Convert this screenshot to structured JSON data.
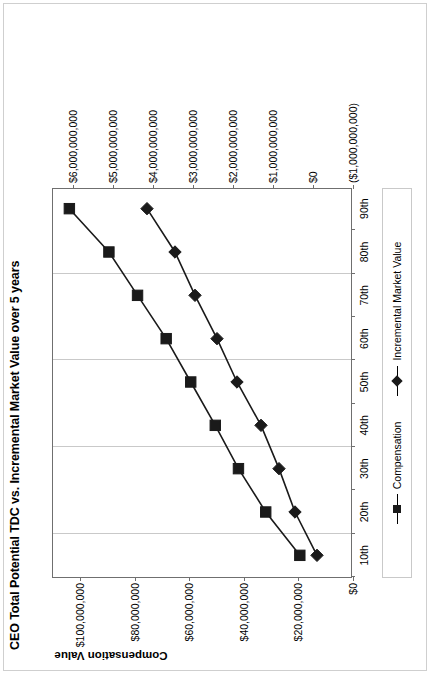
{
  "chart_data": {
    "type": "line",
    "title": "CEO Total Potential TDC vs. Incremental Market Value over 5 years",
    "xlabel": "",
    "categories": [
      "10th",
      "20th",
      "30th",
      "40th",
      "50th",
      "60th",
      "70th",
      "80th",
      "90th"
    ],
    "grid": true,
    "legend_position": "bottom",
    "primary_axis": {
      "label": "Compensation Value",
      "side": "left",
      "ticks": [
        "$0",
        "$20,000,000",
        "$40,000,000",
        "$60,000,000",
        "$80,000,000",
        "$100,000,000"
      ],
      "tick_values": [
        0,
        20000000,
        40000000,
        60000000,
        80000000,
        100000000
      ],
      "ylim": [
        0,
        110000000
      ]
    },
    "secondary_axis": {
      "label": "Incremental Market Value",
      "side": "right",
      "ticks": [
        "($1,000,000,000)",
        "$0",
        "$1,000,000,000",
        "$2,000,000,000",
        "$3,000,000,000",
        "$4,000,000,000",
        "$5,000,000,000",
        "$6,000,000,000"
      ],
      "tick_values": [
        -1000000000,
        0,
        1000000000,
        2000000000,
        3000000000,
        4000000000,
        5000000000,
        6000000000
      ],
      "ylim": [
        -1000000000,
        6500000000
      ]
    },
    "series": [
      {
        "name": "Compensation",
        "axis": "primary",
        "marker": "square",
        "color": "#1a1a1a",
        "values": [
          19500000,
          32000000,
          42000000,
          50500000,
          59500000,
          68500000,
          79000000,
          89500000,
          104000000
        ]
      },
      {
        "name": "Incremental Market Value",
        "axis": "secondary",
        "marker": "diamond",
        "color": "#1a1a1a",
        "values": [
          -100000000,
          450000000,
          850000000,
          1300000000,
          1900000000,
          2400000000,
          2950000000,
          3450000000,
          4150000000
        ]
      }
    ]
  },
  "legend": {
    "items": [
      {
        "label": "Compensation",
        "marker": "square"
      },
      {
        "label": "Incremental Market Value",
        "marker": "diamond"
      }
    ]
  }
}
